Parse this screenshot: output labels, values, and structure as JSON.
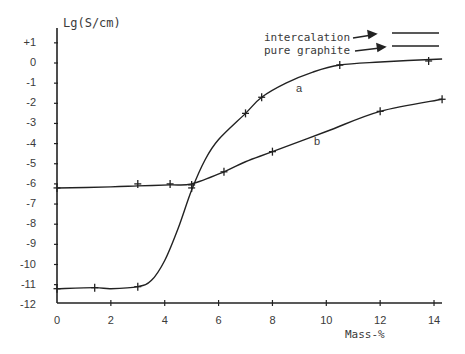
{
  "chart_data": {
    "type": "line",
    "title": "",
    "xlabel": "Mass-%",
    "ylabel": "Lg(S/cm)",
    "xlim": [
      0,
      14.3
    ],
    "ylim": [
      -12,
      1.5
    ],
    "grid": false,
    "legend_position": "top-right",
    "x_ticks": [
      "0",
      "2",
      "4",
      "6",
      "8",
      "10",
      "12",
      "14"
    ],
    "y_ticks": [
      "+1",
      "0",
      "-1",
      "-2",
      "-3",
      "-4",
      "-5",
      "-6",
      "-7",
      "-8",
      "-9",
      "-10",
      "-11",
      "-12"
    ],
    "legend": [
      {
        "label": "intercalation",
        "series": "a"
      },
      {
        "label": "pure graphite",
        "series": "b"
      }
    ],
    "series": [
      {
        "name": "a",
        "legend": "intercalation",
        "points": [
          [
            0,
            -11.2
          ],
          [
            1.4,
            -11.15
          ],
          [
            3,
            -11.1
          ],
          [
            5,
            -6.2
          ],
          [
            7,
            -2.5
          ],
          [
            7.6,
            -1.7
          ],
          [
            10.5,
            -0.1
          ],
          [
            13.8,
            0.1
          ]
        ],
        "curve": [
          [
            0,
            -11.2
          ],
          [
            1.4,
            -11.15
          ],
          [
            2,
            -11.2
          ],
          [
            3,
            -11.1
          ],
          [
            3.5,
            -10.8
          ],
          [
            4,
            -9.8
          ],
          [
            4.5,
            -8.2
          ],
          [
            5,
            -6.3
          ],
          [
            5.5,
            -4.8
          ],
          [
            6,
            -3.8
          ],
          [
            7,
            -2.5
          ],
          [
            7.6,
            -1.7
          ],
          [
            8.5,
            -1.0
          ],
          [
            9.5,
            -0.45
          ],
          [
            10.5,
            -0.1
          ],
          [
            12,
            0.05
          ],
          [
            14.3,
            0.2
          ]
        ]
      },
      {
        "name": "b",
        "legend": "pure graphite",
        "points": [
          [
            0,
            -6.2
          ],
          [
            3,
            -6.0
          ],
          [
            4.2,
            -6.0
          ],
          [
            5,
            -6.05
          ],
          [
            6.2,
            -5.4
          ],
          [
            8,
            -4.4
          ],
          [
            12,
            -2.4
          ],
          [
            14.3,
            -1.8
          ]
        ],
        "curve": [
          [
            0,
            -6.2
          ],
          [
            2,
            -6.15
          ],
          [
            3,
            -6.1
          ],
          [
            4.2,
            -6.05
          ],
          [
            5,
            -6.0
          ],
          [
            6.2,
            -5.4
          ],
          [
            7,
            -4.9
          ],
          [
            8,
            -4.4
          ],
          [
            10,
            -3.4
          ],
          [
            12,
            -2.4
          ],
          [
            14.3,
            -1.8
          ]
        ]
      }
    ],
    "annotations": [
      "a",
      "b"
    ]
  },
  "labels": {
    "ylabel": "Lg(S/cm)",
    "xlabel": "Mass-%",
    "legend_intercalation": "intercalation",
    "legend_pure_graphite": "pure graphite",
    "curve_a": "a",
    "curve_b": "b"
  },
  "colors": {
    "ink": "#222222",
    "text": "#3a3a3a",
    "background": "#ffffff"
  }
}
